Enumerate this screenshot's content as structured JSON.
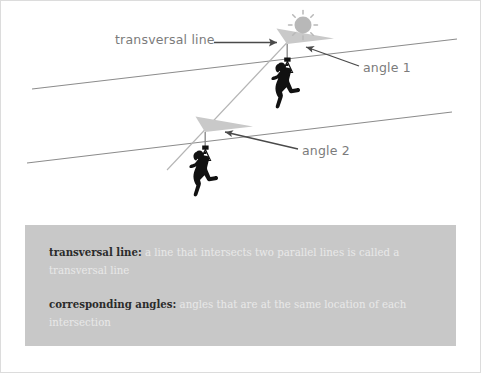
{
  "diagram": {
    "title_alt": "corresponding angles zipline diagram",
    "labels": {
      "transversal_line": "transversal line",
      "angle_1": "angle 1",
      "angle_2": "angle 2"
    },
    "icons": {
      "sun": "sun-icon",
      "zipline_rider_upper": "zipline-rider-icon",
      "zipline_rider_lower": "zipline-rider-icon",
      "arrow_transversal": "arrow-right-icon",
      "arrow_angle_1": "arrow-left-icon",
      "arrow_angle_2": "arrow-left-icon"
    },
    "colors": {
      "line": "#8c8c8c",
      "angle_fill": "#c9c9c9",
      "label_text": "#7b7b7b",
      "sun": "#b8b8b8",
      "figure": "#111111",
      "infobox_bg": "#c8c8c8",
      "term_text": "#2b2b2b",
      "definition_text": "#e8e8e8",
      "page_border": "#dcdcdc"
    },
    "geometry": {
      "parallel_line_1": {
        "x1": 31,
        "y1": 88,
        "x2": 456,
        "y2": 38
      },
      "parallel_line_2": {
        "x1": 26,
        "y1": 162,
        "x2": 451,
        "y2": 111
      },
      "transversal_line": {
        "x1": 166,
        "y1": 169,
        "x2": 296,
        "y2": 31
      },
      "intersection_1": {
        "x": 286,
        "y": 43
      },
      "intersection_2": {
        "x": 204,
        "y": 131
      }
    }
  },
  "infobox": {
    "definitions": [
      {
        "term": "transversal line:",
        "text": " a line that intersects two parallel lines is called a transversal line"
      },
      {
        "term": "corresponding angles:",
        "text": " angles that are at the same location of each intersection"
      }
    ]
  }
}
